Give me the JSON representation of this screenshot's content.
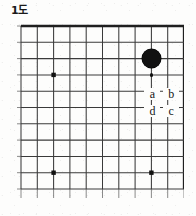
{
  "figure": {
    "title": "1도",
    "kind": "go-board-diagram",
    "background_color": "#fdfdfc",
    "line_color": "#3a3a3a",
    "border_color": "#1f1f1f",
    "stone_color": "#111111",
    "label_color": "#151515"
  },
  "board": {
    "columns": 11,
    "rows": 11,
    "cell_size": 16.3,
    "origin_x": 4,
    "origin_y": 4,
    "thick_edges": [
      "top",
      "right"
    ],
    "star_points": [
      {
        "col": 2,
        "row": 3
      },
      {
        "col": 2,
        "row": 9
      },
      {
        "col": 8,
        "row": 9
      }
    ]
  },
  "stones": [
    {
      "id": "black-stone-1",
      "color": "black",
      "col": 8,
      "row": 2,
      "radius": 9.5
    }
  ],
  "markers": [
    {
      "id": "marker-dot-1",
      "col": 8,
      "row": 3,
      "radius": 1.9
    }
  ],
  "labels": [
    {
      "id": "label-a",
      "text": "a",
      "col": 8,
      "row": 4.2
    },
    {
      "id": "label-b",
      "text": "b",
      "col": 9.15,
      "row": 4.2
    },
    {
      "id": "label-d",
      "text": "d",
      "col": 8,
      "row": 5.2
    },
    {
      "id": "label-c",
      "text": "c",
      "col": 9.15,
      "row": 5.2
    }
  ]
}
